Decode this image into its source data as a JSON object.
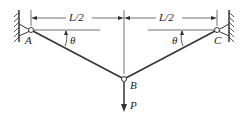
{
  "diagram": {
    "type": "two-bar truss with central load",
    "labels": {
      "support_left": "A",
      "support_right": "C",
      "joint": "B",
      "load": "P",
      "angle_left": "θ",
      "angle_right": "θ",
      "dim_left": "L/2",
      "dim_right": "L/2"
    },
    "colors": {
      "line": "#333333",
      "background": "#ffffff"
    }
  }
}
